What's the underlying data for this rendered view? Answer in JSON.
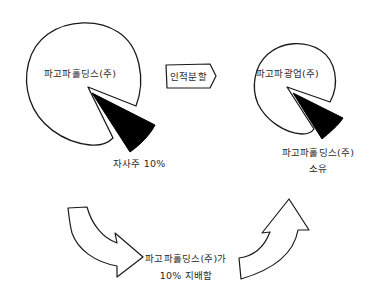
{
  "diagram": {
    "left_pie": {
      "label": "파고파홀딩스(주)",
      "wedge_label": "자사주 10%"
    },
    "split_tag": {
      "label": "인적분할"
    },
    "right_pie": {
      "label": "파고파광업(주)",
      "wedge_label_line1": "파고파홀딩스(주)",
      "wedge_label_line2": "소유"
    },
    "bottom_note": {
      "line1": "파고파홀딩스(주)가",
      "line2": "10% 지배함"
    },
    "colors": {
      "stroke": "#1a1a1a",
      "wedge_fill": "#000000",
      "background": "#ffffff"
    }
  }
}
